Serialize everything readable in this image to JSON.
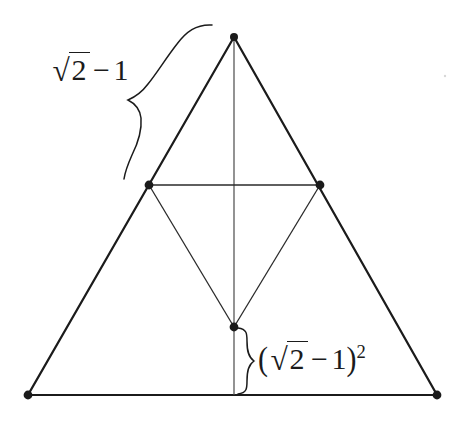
{
  "figure": {
    "type": "geometric-diagram",
    "canvas": {
      "width": 468,
      "height": 426,
      "background": "#ffffff"
    },
    "stroke_color": "#1b1b1b",
    "outer_triangle": {
      "name": "outer-triangle",
      "stroke_width": 2.2,
      "vertices": [
        {
          "name": "apex",
          "x": 234,
          "y": 37
        },
        {
          "name": "bottom-left",
          "x": 28,
          "y": 395
        },
        {
          "name": "bottom-right",
          "x": 437,
          "y": 395
        }
      ]
    },
    "inner_triangle": {
      "name": "inner-inverted-triangle",
      "stroke_width": 1.1,
      "vertices": [
        {
          "name": "left-midpoint",
          "x": 149,
          "y": 185
        },
        {
          "name": "right-midpoint",
          "x": 320,
          "y": 185
        },
        {
          "name": "inner-bottom",
          "x": 234,
          "y": 327
        }
      ]
    },
    "center_line": {
      "name": "vertical-axis",
      "stroke_width": 1.1,
      "x1": 234,
      "y1": 37,
      "x2": 234,
      "y2": 395
    },
    "points": [
      {
        "name": "apex-point",
        "x": 234,
        "y": 37,
        "r": 4.0
      },
      {
        "name": "left-midpoint-point",
        "x": 149,
        "y": 185,
        "r": 4.4
      },
      {
        "name": "right-midpoint-point",
        "x": 320,
        "y": 185,
        "r": 4.4
      },
      {
        "name": "inner-bottom-point",
        "x": 234,
        "y": 327,
        "r": 4.4
      },
      {
        "name": "bottom-left-point",
        "x": 28,
        "y": 395,
        "r": 4.4
      },
      {
        "name": "bottom-right-point",
        "x": 437,
        "y": 395,
        "r": 4.4
      }
    ],
    "speck": {
      "name": "stray-speck",
      "x": 445,
      "y": 76,
      "r": 1.1
    }
  },
  "labels": {
    "side": {
      "name": "side-length-label",
      "text": "√2 − 1",
      "radicand": "2",
      "radical_sign": "√",
      "minus": "−",
      "subtrahend": "1",
      "meaning": "length of upper sub-triangle side",
      "brace": {
        "name": "slanted-brace",
        "orientation": "slanted-left-edge",
        "tip_x": 128,
        "tip_y": 101,
        "start_x": 212,
        "start_y": 25,
        "end_x": 124,
        "end_y": 178
      }
    },
    "inner": {
      "name": "inner-height-label",
      "text": "(√2 − 1)²",
      "open_paren": "(",
      "radical_sign": "√",
      "radicand": "2",
      "minus": "−",
      "subtrahend": "1",
      "close_paren": ")",
      "exponent": "2",
      "meaning": "height from inner vertex to base",
      "brace": {
        "name": "vertical-brace",
        "orientation": "vertical-right",
        "tip_x": 254,
        "tip_y": 361,
        "top_x": 238,
        "top_y": 328,
        "bottom_x": 238,
        "bottom_y": 394
      }
    }
  }
}
